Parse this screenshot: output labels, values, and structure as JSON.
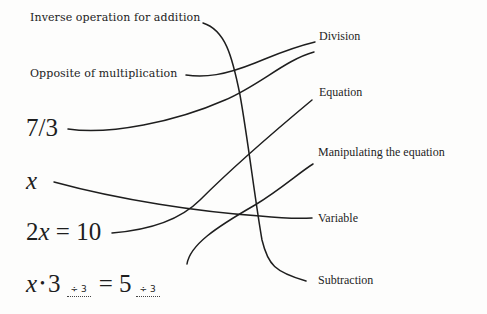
{
  "left_items": {
    "inverse_addition": "Inverse operation for addition",
    "opposite_multiplication": "Opposite of multiplication",
    "fraction": "7/3",
    "variable_x": "x",
    "equation": {
      "coef": "2",
      "var": "x",
      "rest": " = 10"
    },
    "manipulation": {
      "var": "x",
      "dot": "•",
      "three": "3",
      "op1": "÷ 3",
      "equals": "= 5",
      "op2": "÷ 3"
    }
  },
  "right_items": {
    "division": "Division",
    "equation": "Equation",
    "manipulating": "Manipulating the equation",
    "variable": "Variable",
    "subtraction": "Subtraction"
  },
  "connections": [
    {
      "from": "Inverse operation for addition",
      "to": "Subtraction"
    },
    {
      "from": "Opposite of multiplication",
      "to": "Division"
    },
    {
      "from": "7/3",
      "to": "Division"
    },
    {
      "from": "x",
      "to": "Variable"
    },
    {
      "from": "2x = 10",
      "to": "Equation"
    },
    {
      "from": "x·3 ÷3 = 5 ÷3",
      "to": "Manipulating the equation"
    }
  ]
}
